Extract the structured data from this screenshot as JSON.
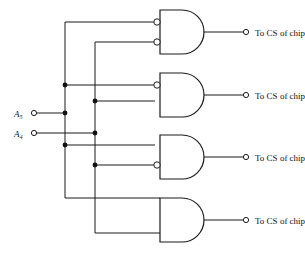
{
  "diagram": {
    "line_color": "#1a1a1a",
    "background": "#ffffff",
    "inputs": [
      {
        "name": "A5",
        "label": "A",
        "subscript": "5",
        "terminal": "open-circle",
        "y": 113
      },
      {
        "name": "A4",
        "label": "A",
        "subscript": "4",
        "terminal": "open-circle",
        "y": 133
      }
    ],
    "buses": [
      {
        "name": "a5-bus",
        "x": 65,
        "source": "A5"
      },
      {
        "name": "a4-bus",
        "x": 95,
        "source": "A4"
      }
    ],
    "gates": [
      {
        "id": "gate1",
        "type": "AND",
        "top_input_inverted": true,
        "bottom_input_inverted": true,
        "top_input_source": "A5",
        "bottom_input_source": "A4",
        "output_label": "To CS of chip 1",
        "output_terminal": "open-circle"
      },
      {
        "id": "gate2",
        "type": "AND",
        "top_input_inverted": true,
        "bottom_input_inverted": false,
        "top_input_source": "A5",
        "bottom_input_source": "A4",
        "output_label": "To CS of chip 2",
        "output_terminal": "open-circle"
      },
      {
        "id": "gate3",
        "type": "AND",
        "top_input_inverted": false,
        "bottom_input_inverted": true,
        "top_input_source": "A5",
        "bottom_input_source": "A4",
        "output_label": "To CS of chip 3",
        "output_terminal": "open-circle"
      },
      {
        "id": "gate4",
        "type": "AND",
        "top_input_inverted": false,
        "bottom_input_inverted": false,
        "top_input_source": "A5",
        "bottom_input_source": "A4",
        "output_label": "To CS of chip 4",
        "output_terminal": "open-circle"
      }
    ],
    "junction_dots": [
      {
        "name": "dot-a5-gate2",
        "x": 65,
        "y": 85
      },
      {
        "name": "dot-a5-input",
        "x": 65,
        "y": 113
      },
      {
        "name": "dot-a5-gate3",
        "x": 65,
        "y": 145
      },
      {
        "name": "dot-a4-gate2",
        "x": 95,
        "y": 101
      },
      {
        "name": "dot-a4-input",
        "x": 95,
        "y": 133
      },
      {
        "name": "dot-a4-gate3",
        "x": 95,
        "y": 165
      }
    ]
  }
}
